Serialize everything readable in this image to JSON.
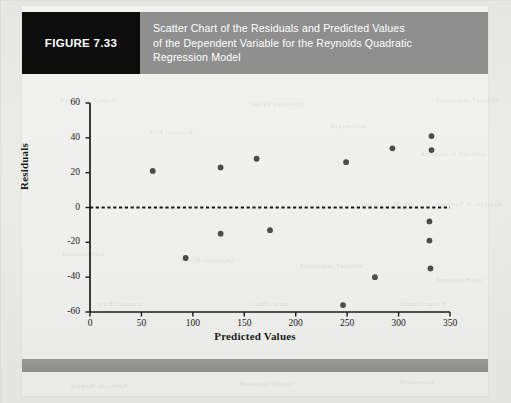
{
  "figure": {
    "number_label": "FIGURE 7.33",
    "title_lines": [
      "Scatter Chart of the Residuals and Predicted Values",
      "of the Dependent Variable for the Reynolds Quadratic",
      "Regression Model"
    ],
    "label_box_color": "#0d0d0d",
    "title_bar_color": "#8f8f8f",
    "footer_bar_color": "#949494"
  },
  "chart_data": {
    "type": "scatter",
    "title": "",
    "xlabel": "Predicted Values",
    "ylabel": "Residuals",
    "xlim": [
      0,
      350
    ],
    "ylim": [
      -60,
      60
    ],
    "xticks": [
      0,
      50,
      100,
      150,
      200,
      250,
      300,
      350
    ],
    "yticks": [
      60,
      40,
      20,
      0,
      -20,
      -40,
      -60
    ],
    "xtick_labels": [
      "0",
      "50",
      "100",
      "150",
      "200",
      "250",
      "300",
      "350"
    ],
    "ytick_labels": [
      "60",
      "40",
      "20",
      "0",
      "-20",
      "-40",
      "-60"
    ],
    "grid": false,
    "legend": null,
    "reference_line": {
      "y": 0,
      "style": "dashed",
      "color": "#1a1a1a"
    },
    "marker_color": "#4b4b50",
    "points": [
      {
        "x": 61,
        "y": 21
      },
      {
        "x": 93,
        "y": -29
      },
      {
        "x": 127,
        "y": 23
      },
      {
        "x": 127,
        "y": -15
      },
      {
        "x": 162,
        "y": 28
      },
      {
        "x": 175,
        "y": -13
      },
      {
        "x": 246,
        "y": -56
      },
      {
        "x": 249,
        "y": 26
      },
      {
        "x": 277,
        "y": -40
      },
      {
        "x": 294,
        "y": 34
      },
      {
        "x": 330,
        "y": -8
      },
      {
        "x": 330,
        "y": -19
      },
      {
        "x": 331,
        "y": -35
      },
      {
        "x": 332,
        "y": 41
      },
      {
        "x": 332,
        "y": 33
      }
    ]
  },
  "ghost_text": [
    "Reynolds Number",
    "Predicted Values",
    "Regression",
    "Residual Plot",
    "Quadratic Model",
    "Dependent Variable",
    "Analysis of Variance",
    "Standard Error",
    "Coefficients",
    "Significance F"
  ]
}
